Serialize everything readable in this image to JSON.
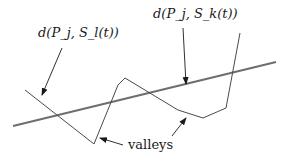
{
  "diagram": {
    "labels": {
      "left_distance": "d(P_j, S_l(t))",
      "right_distance": "d(P_j, S_k(t))",
      "valleys": "valleys"
    },
    "elements": {
      "straight_line": "reference line (thick gray)",
      "zigzag_curve": "piecewise-linear distance curve"
    },
    "colors": {
      "line": "#6e6e6e",
      "curve": "#4a4a4a",
      "text": "#1a1a1a"
    }
  }
}
